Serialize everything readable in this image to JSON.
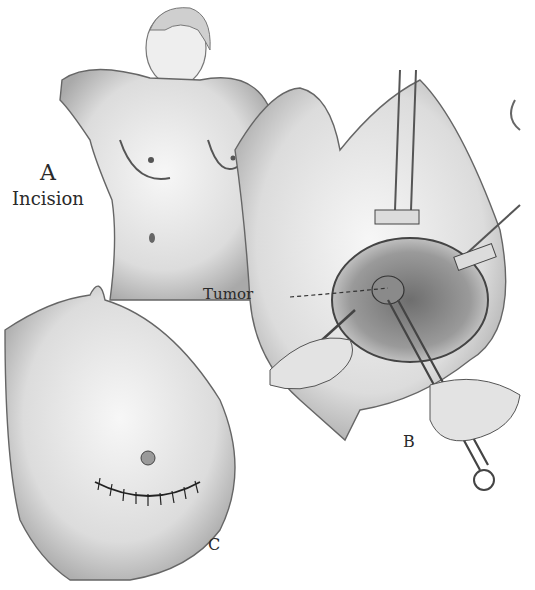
{
  "figure": {
    "panels": [
      {
        "id": "A",
        "letter": "A",
        "caption": "Incision"
      },
      {
        "id": "B",
        "letter": "B",
        "callout": "Tumor"
      },
      {
        "id": "C",
        "letter": "C"
      }
    ],
    "colors": {
      "background": "#ffffff",
      "ink": "#2a2a2a",
      "shade": "#bdbdbd",
      "light_shade": "#e6e6e6"
    }
  }
}
